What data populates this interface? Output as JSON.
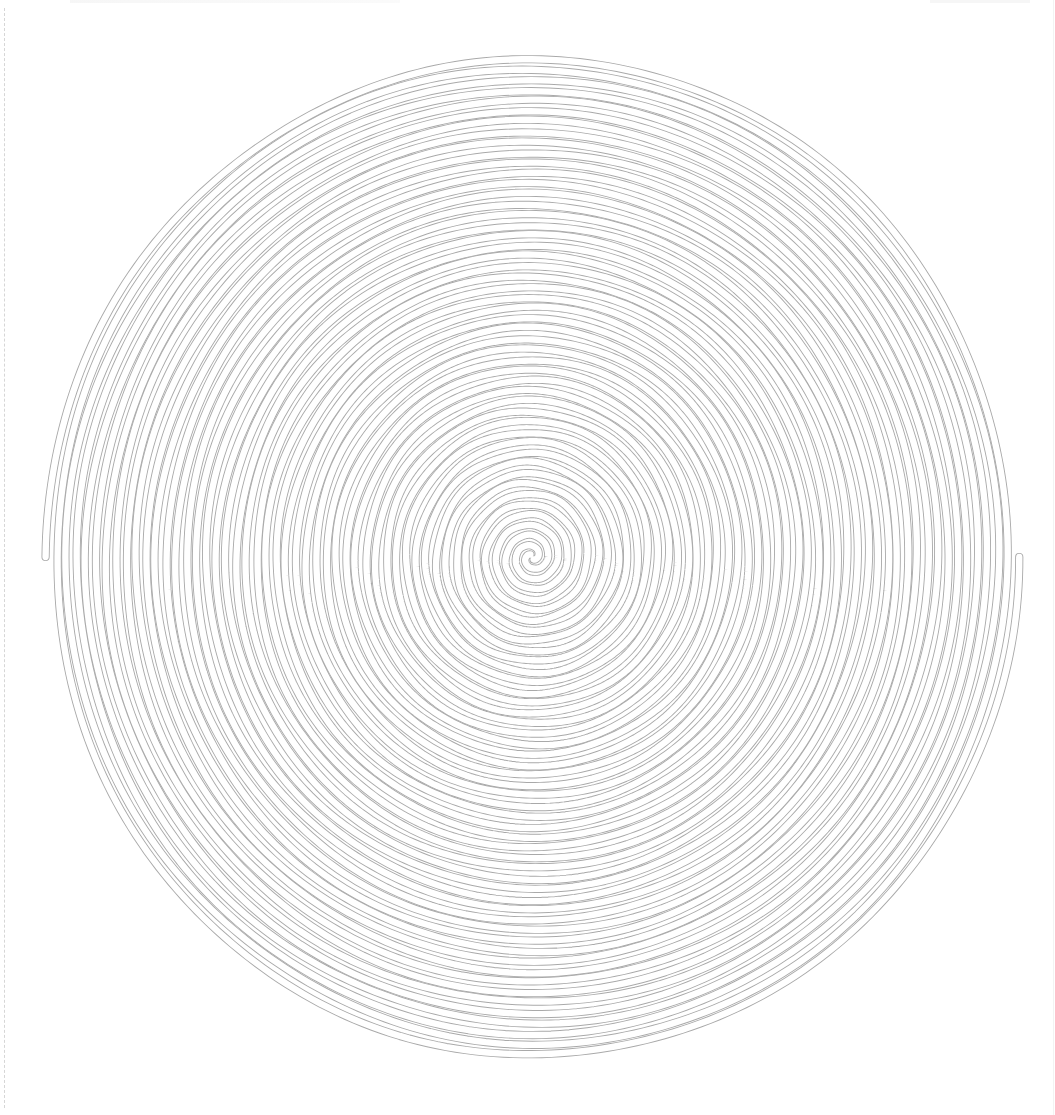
{
  "canvas": {
    "width": 1055,
    "height": 1115,
    "background": "#ffffff"
  },
  "spiral": {
    "type": "double-archimedean-tube",
    "center": {
      "x": 532,
      "y": 557
    },
    "outer_radius_x": 486,
    "outer_radius_y": 503,
    "arms": 2,
    "ring_spacing_px": 10,
    "tube_width_px": 7,
    "line_color": "#a9a9a9",
    "fill_color": "#ffffff",
    "wobble_amplitude_px": 1.6,
    "ends": [
      {
        "side": "left",
        "x": 45,
        "y": 556
      },
      {
        "side": "right",
        "x": 1015,
        "y": 560
      }
    ]
  },
  "guides": {
    "left_dashed_color": "#d6d6d6",
    "right_line_color": "#f3f3f3"
  }
}
